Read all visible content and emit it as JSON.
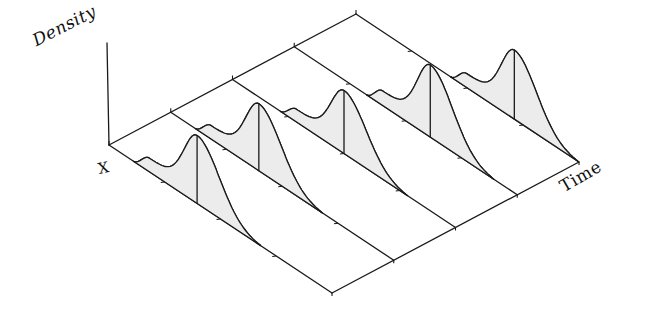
{
  "labels": {
    "density_axis": "Density",
    "x_axis": "X",
    "time_axis": "Time"
  },
  "colors": {
    "line": "#1a1a1a",
    "fill": "#ececec",
    "background": "#ffffff"
  },
  "chart_data": {
    "type": "area",
    "title": "",
    "xlabel": "X",
    "ylabel": "Density",
    "zlabel": "Time",
    "grid": false,
    "legend": null,
    "time_slices": [
      0,
      0.25,
      0.5,
      0.75,
      1.0
    ],
    "x_ticks": [
      0.25,
      0.5,
      0.75
    ],
    "series": [
      {
        "name": "t0",
        "time": 0.0,
        "mode_x": 0.395,
        "peak_density": 68
      },
      {
        "name": "t1",
        "time": 0.25,
        "mode_x": 0.395,
        "peak_density": 67
      },
      {
        "name": "t2",
        "time": 0.5,
        "mode_x": 0.5,
        "peak_density": 63
      },
      {
        "name": "t3",
        "time": 0.75,
        "mode_x": 0.61,
        "peak_density": 72
      },
      {
        "name": "t4",
        "time": 1.0,
        "mode_x": 0.71,
        "peak_density": 69
      }
    ],
    "shape": {
      "half_width": 0.285,
      "left_sigma": 0.08,
      "right_sigma": 0.14,
      "shoulder": 0.2
    },
    "projection": {
      "origin": [
        109,
        145
      ],
      "x_vector": [
        223,
        148
      ],
      "time_vector": [
        247,
        -131
      ],
      "density_top": [
        107,
        43
      ]
    }
  }
}
